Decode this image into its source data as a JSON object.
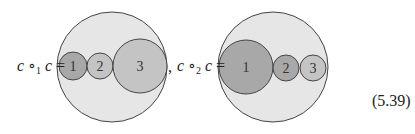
{
  "equation": {
    "lhs1": "c ∘",
    "sub1": "1",
    "rhs1": "c =",
    "separator": ",",
    "lhs2": "c ∘",
    "sub2": "2",
    "rhs2": "c =",
    "number": "(5.39)"
  },
  "diagram1": {
    "labels": [
      "1",
      "2",
      "3"
    ]
  },
  "diagram2": {
    "labels": [
      "1",
      "2",
      "3"
    ]
  },
  "colors": {
    "outer": "#e6e6e6",
    "dark": "#a8a8a8",
    "medium": "#c4c4c4",
    "stroke": "#444444"
  }
}
